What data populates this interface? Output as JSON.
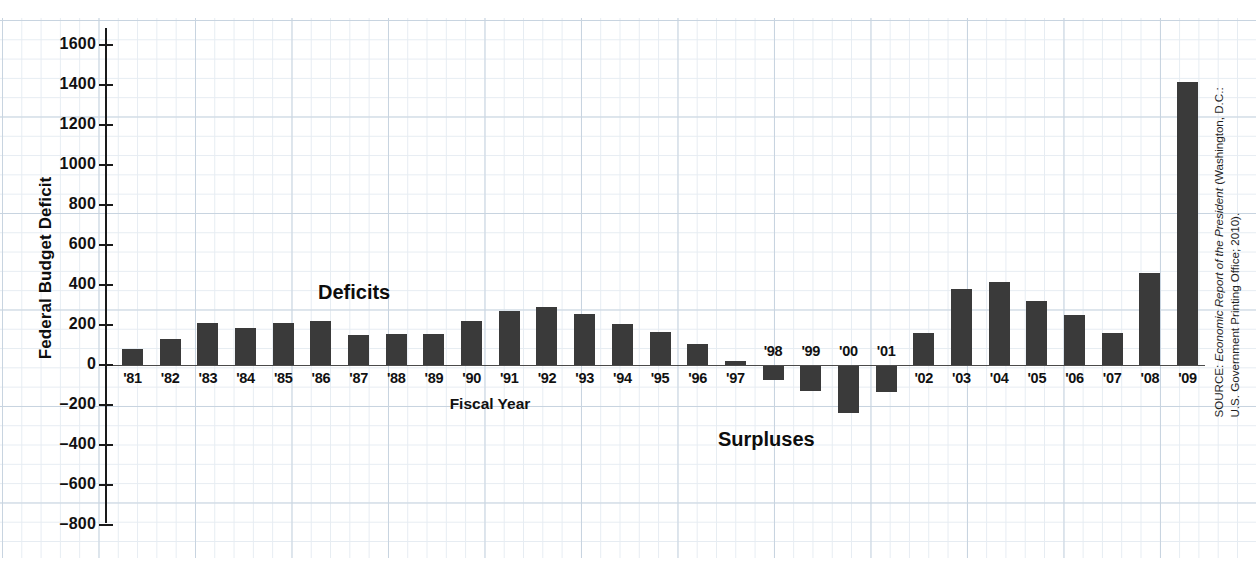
{
  "chart_data": {
    "type": "bar",
    "title": "",
    "xlabel": "Fiscal Year",
    "ylabel": "Federal Budget Deficit",
    "ylim": [
      -900,
      1700
    ],
    "ytick_values": [
      1600,
      1400,
      1200,
      1000,
      800,
      600,
      400,
      200,
      0,
      -200,
      -400,
      -600,
      -800
    ],
    "ytick_labels": [
      "1600",
      "1400",
      "1200",
      "1000",
      "800",
      "600",
      "400",
      "200",
      "0",
      "–200",
      "–400",
      "–600",
      "–800"
    ],
    "categories": [
      "'81",
      "'82",
      "'83",
      "'84",
      "'85",
      "'86",
      "'87",
      "'88",
      "'89",
      "'90",
      "'91",
      "'92",
      "'93",
      "'94",
      "'95",
      "'96",
      "'97",
      "'98",
      "'99",
      "'00",
      "'01",
      "'02",
      "'03",
      "'04",
      "'05",
      "'06",
      "'07",
      "'08",
      "'09"
    ],
    "values": [
      79,
      128,
      208,
      185,
      212,
      221,
      150,
      155,
      153,
      221,
      269,
      290,
      255,
      203,
      164,
      107,
      22,
      -69,
      -126,
      -236,
      -128,
      158,
      378,
      413,
      318,
      248,
      161,
      459,
      1413
    ],
    "grid": true,
    "legend": "none",
    "annotations": [
      {
        "text": "Deficits",
        "x": "'87",
        "y": 520
      },
      {
        "text": "Surpluses",
        "x": "'01",
        "y": -330
      }
    ],
    "bar_color": "#3a3a3a",
    "grid_color": "#c8d4e0"
  },
  "axis": {
    "y_title": "Federal Budget Deficit",
    "x_title": "Fiscal Year"
  },
  "annotations": {
    "deficits": "Deficits",
    "surpluses": "Surpluses"
  },
  "source": {
    "label": "SOURCE: ",
    "title": "Economic Report of the President",
    "rest": " (Washington, D.C.: U.S. Government Printing Office; 2010)."
  }
}
